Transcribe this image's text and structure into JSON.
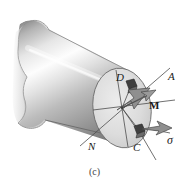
{
  "figure": {
    "caption": "(c)",
    "background_color": "#ffffff"
  },
  "labels": {
    "point_d": "D",
    "point_a": "A",
    "point_n": "N",
    "point_c": "C",
    "moment_vector": "M",
    "stress_sigma": "σ"
  },
  "colors": {
    "outline": "#3a3a3a",
    "cylinder_light": "#f2f2f2",
    "cylinder_mid": "#b9b9b9",
    "cylinder_dark": "#777777",
    "end_face_fill": "#d8d8d8",
    "element_dark": "#4a4a4a",
    "arrow_fill": "#8f8f8f",
    "label_color": "#1a1a1a",
    "caption_color": "#444444"
  },
  "geometry": {
    "end_face_center": [
      122,
      108
    ],
    "end_face_rx": 29,
    "end_face_ry": 40,
    "axis_na_start": [
      77,
      148
    ],
    "axis_na_end": [
      168,
      70
    ],
    "point_d_marker": [
      131,
      85
    ],
    "point_c_marker": [
      139,
      131
    ]
  }
}
